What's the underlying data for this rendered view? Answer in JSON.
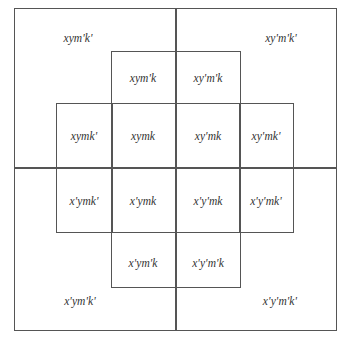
{
  "diagram": {
    "type": "karnaugh-style-venn-grid",
    "variables": [
      "x",
      "y",
      "m",
      "k"
    ],
    "outer_corners": {
      "top_left": "xym'k'",
      "top_right": "xy'm'k'",
      "bottom_left": "x'ym'k'",
      "bottom_right": "x'y'm'k'"
    },
    "row1": [
      "xym'k",
      "xy'm'k"
    ],
    "row2": [
      "xymk'",
      "xymk",
      "xy'mk",
      "xy'mk'"
    ],
    "row3": [
      "x'ymk'",
      "x'ymk",
      "x'y'mk",
      "x'y'mk'"
    ],
    "row4": [
      "x'ym'k",
      "x'y'm'k"
    ]
  }
}
